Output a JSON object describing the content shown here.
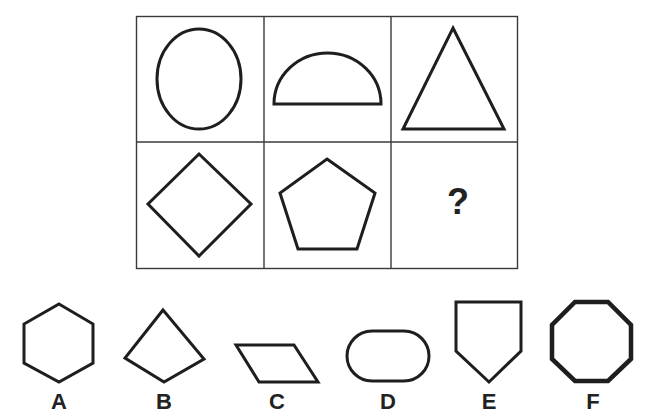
{
  "puzzle": {
    "grid": {
      "rows": 2,
      "cols": 3,
      "cells": [
        {
          "row": 0,
          "col": 0,
          "shape": "ellipse"
        },
        {
          "row": 0,
          "col": 1,
          "shape": "semicircle"
        },
        {
          "row": 0,
          "col": 2,
          "shape": "triangle"
        },
        {
          "row": 1,
          "col": 0,
          "shape": "diamond"
        },
        {
          "row": 1,
          "col": 1,
          "shape": "pentagon"
        },
        {
          "row": 1,
          "col": 2,
          "shape": "missing",
          "text": "?"
        }
      ]
    },
    "question_mark": "?",
    "options": [
      {
        "label": "A",
        "shape": "hexagon"
      },
      {
        "label": "B",
        "shape": "kite"
      },
      {
        "label": "C",
        "shape": "parallelogram"
      },
      {
        "label": "D",
        "shape": "stadium"
      },
      {
        "label": "E",
        "shape": "shield-pentagon"
      },
      {
        "label": "F",
        "shape": "octagon"
      }
    ],
    "colors": {
      "stroke": "#1e1e1e",
      "background": "#ffffff",
      "grid_line": "#3a3a3a"
    }
  }
}
